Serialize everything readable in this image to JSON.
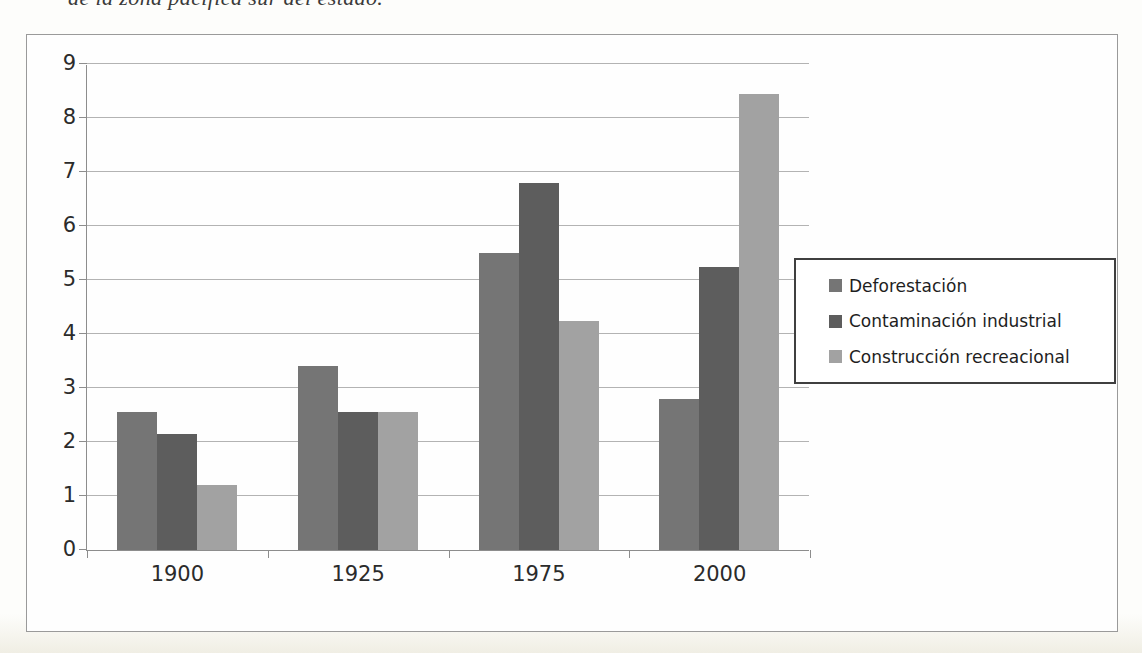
{
  "caption": {
    "text": "de la zona pacífica sur del estado."
  },
  "chart_data": {
    "type": "bar",
    "title": "",
    "xlabel": "",
    "ylabel": "",
    "categories": [
      "1900",
      "1925",
      "1975",
      "2000"
    ],
    "series": [
      {
        "name": "Deforestación",
        "color": "#757575",
        "values": [
          2.55,
          3.4,
          5.5,
          2.8
        ]
      },
      {
        "name": "Contaminación industrial",
        "color": "#5d5d5d",
        "values": [
          2.15,
          2.55,
          6.8,
          5.25
        ]
      },
      {
        "name": "Construcción recreacional",
        "color": "#a2a2a2",
        "values": [
          1.2,
          2.55,
          4.25,
          8.45
        ]
      }
    ],
    "ylim": [
      0,
      9
    ],
    "ytick_step": 1,
    "grid": true,
    "legend_position": "right-overlay"
  },
  "colors": {
    "gridline": "#b3b3b3",
    "axis": "#8d8d8d",
    "tick_text": "#2b2b2b",
    "chart_border": "#9a9a9a",
    "legend_border": "#3f3f3f",
    "background": "#fefefe"
  }
}
